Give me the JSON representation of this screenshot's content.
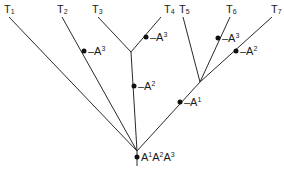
{
  "diagram": {
    "type": "phylogenetic-tree",
    "colors": {
      "line": "#2a2a2a",
      "dot": "#111111",
      "text": "#1a1a1a",
      "background": "#ffffff"
    },
    "taxa": [
      {
        "id": "T1",
        "base": "T",
        "sub": "1",
        "x": 4,
        "y": 13
      },
      {
        "id": "T2",
        "base": "T",
        "sub": "2",
        "x": 57,
        "y": 13
      },
      {
        "id": "T3",
        "base": "T",
        "sub": "3",
        "x": 92,
        "y": 13
      },
      {
        "id": "T4",
        "base": "T",
        "sub": "4",
        "x": 164,
        "y": 13
      },
      {
        "id": "T5",
        "base": "T",
        "sub": "5",
        "x": 179,
        "y": 13
      },
      {
        "id": "T6",
        "base": "T",
        "sub": "6",
        "x": 226,
        "y": 13
      },
      {
        "id": "T7",
        "base": "T",
        "sub": "7",
        "x": 271,
        "y": 13
      }
    ],
    "nodes": {
      "root": {
        "x": 137,
        "y": 151
      },
      "root_base": {
        "x": 137,
        "y": 166
      },
      "n34": {
        "x": 131,
        "y": 52
      },
      "n567": {
        "x": 200,
        "y": 82
      }
    },
    "edges": [
      {
        "name": "edge-t1",
        "x1": 9,
        "y1": 17,
        "x2": 137,
        "y2": 151
      },
      {
        "name": "edge-t2",
        "x1": 62,
        "y1": 17,
        "x2": 137,
        "y2": 151
      },
      {
        "name": "edge-t3",
        "x1": 98,
        "y1": 17,
        "x2": 131,
        "y2": 52
      },
      {
        "name": "edge-t4",
        "x1": 161,
        "y1": 17,
        "x2": 131,
        "y2": 52
      },
      {
        "name": "edge-n34",
        "x1": 131,
        "y1": 52,
        "x2": 137,
        "y2": 151
      },
      {
        "name": "edge-t5",
        "x1": 183,
        "y1": 17,
        "x2": 200,
        "y2": 82
      },
      {
        "name": "edge-t6",
        "x1": 230,
        "y1": 17,
        "x2": 200,
        "y2": 82
      },
      {
        "name": "edge-t7",
        "x1": 272,
        "y1": 17,
        "x2": 200,
        "y2": 82
      },
      {
        "name": "edge-n567",
        "x1": 200,
        "y1": 82,
        "x2": 137,
        "y2": 151
      },
      {
        "name": "edge-root",
        "x1": 137,
        "y1": 151,
        "x2": 137,
        "y2": 166
      }
    ],
    "markers": [
      {
        "name": "marker-t2",
        "x": 84,
        "y": 51,
        "prefix": "–A",
        "sup": "3",
        "text": "-A³"
      },
      {
        "name": "marker-t4",
        "x": 146,
        "y": 37,
        "prefix": "–A",
        "sup": "3",
        "text": "-A³"
      },
      {
        "name": "marker-n34",
        "x": 134,
        "y": 86,
        "prefix": "–A",
        "sup": "2",
        "text": "-A²"
      },
      {
        "name": "marker-t6",
        "x": 218,
        "y": 38,
        "prefix": "–A",
        "sup": "3",
        "text": "-A³"
      },
      {
        "name": "marker-t7",
        "x": 236,
        "y": 51,
        "prefix": "–A",
        "sup": "2",
        "text": "-A²"
      },
      {
        "name": "marker-n567",
        "x": 180,
        "y": 102,
        "prefix": "–A",
        "sup": "1",
        "text": "-A¹"
      }
    ],
    "root_marker": {
      "x": 138,
      "y": 157,
      "text": "A¹A²A³",
      "parts": [
        "A",
        "1",
        "A",
        "2",
        "A",
        "3"
      ]
    }
  }
}
